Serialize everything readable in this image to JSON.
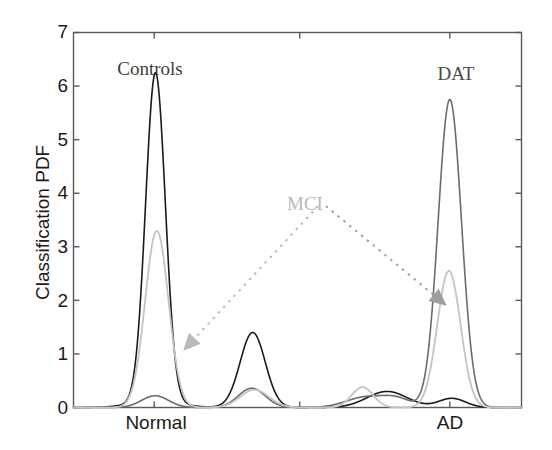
{
  "figure": {
    "background_color": "#ffffff",
    "axis_color": "#595959"
  },
  "axes": {
    "y_title": "Classification PDF",
    "y_ticks": [
      "0",
      "1",
      "2",
      "3",
      "4",
      "5",
      "6",
      "7"
    ],
    "x_ticks": [
      "Normal",
      "AD"
    ]
  },
  "annotations": {
    "controls": "Controls",
    "dat": "DAT",
    "mci": "MCI"
  },
  "chart_data": {
    "type": "line",
    "title": "",
    "xlabel": "",
    "ylabel": "Classification PDF",
    "xlim": [
      0,
      1
    ],
    "ylim": [
      0,
      7
    ],
    "y_ticks": [
      0,
      1,
      2,
      3,
      4,
      5,
      6,
      7
    ],
    "x_tick_positions": [
      0.18,
      0.505,
      0.84
    ],
    "x_tick_labels": [
      "Normal",
      "",
      "AD"
    ],
    "grid": false,
    "legend": "none",
    "annotations": [
      {
        "text": "Controls",
        "x": 0.172,
        "y": 6.6,
        "color": "#3d3d3d"
      },
      {
        "text": "DAT",
        "x": 0.852,
        "y": 6.5,
        "color": "#4a4a4a"
      },
      {
        "text": "MCI",
        "x": 0.515,
        "y": 3.95,
        "color": "#b9b9b9"
      }
    ],
    "leader_lines": [
      {
        "from": [
          0.545,
          3.75
        ],
        "to": [
          0.245,
          1.06
        ],
        "style": "dotted",
        "color": "#b9b9b9",
        "arrow": "triangle"
      },
      {
        "from": [
          0.565,
          3.75
        ],
        "to": [
          0.833,
          1.9
        ],
        "style": "dotted",
        "color": "#9e9e9e",
        "arrow": "triangle"
      }
    ],
    "series": [
      {
        "name": "Controls classifier PDF",
        "color": "#1a1a1a",
        "line_width": 1.6,
        "peaks": [
          {
            "center": 0.183,
            "height": 6.15,
            "width": 0.022
          },
          {
            "center": 0.183,
            "height": 0.1,
            "width": 0.055
          },
          {
            "center": 0.4,
            "height": 1.4,
            "width": 0.028
          },
          {
            "center": 0.7,
            "height": 0.3,
            "width": 0.045
          },
          {
            "center": 0.845,
            "height": 0.17,
            "width": 0.03
          }
        ]
      },
      {
        "name": "MCI classifier PDF",
        "color": "#6b6b6b",
        "line_width": 1.6,
        "peaks": [
          {
            "center": 0.182,
            "height": 0.22,
            "width": 0.03
          },
          {
            "center": 0.398,
            "height": 0.36,
            "width": 0.03
          },
          {
            "center": 0.655,
            "height": 0.2,
            "width": 0.045
          },
          {
            "center": 0.723,
            "height": 0.14,
            "width": 0.03
          },
          {
            "center": 0.84,
            "height": 5.75,
            "width": 0.026
          }
        ]
      },
      {
        "name": "DAT classifier PDF",
        "color": "#c4c4c4",
        "line_width": 1.8,
        "peaks": [
          {
            "center": 0.186,
            "height": 3.3,
            "width": 0.026
          },
          {
            "center": 0.404,
            "height": 0.33,
            "width": 0.032
          },
          {
            "center": 0.645,
            "height": 0.38,
            "width": 0.024
          },
          {
            "center": 0.838,
            "height": 2.55,
            "width": 0.026
          }
        ]
      }
    ],
    "peak_summary": [
      {
        "label": "Controls peak (black)",
        "x_label": "Normal",
        "value": 6.15
      },
      {
        "label": "Controls peak (light gray)",
        "x_label": "Normal",
        "value": 3.3
      },
      {
        "label": "Mid peak (black)",
        "x_label": "mid",
        "value": 1.4
      },
      {
        "label": "DAT peak (dark gray)",
        "x_label": "AD",
        "value": 5.75
      },
      {
        "label": "DAT peak (light gray)",
        "x_label": "AD",
        "value": 2.55
      }
    ]
  }
}
